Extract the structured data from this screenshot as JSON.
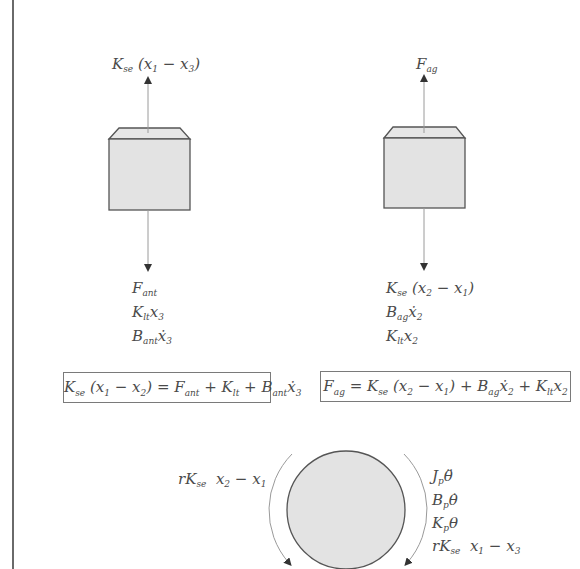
{
  "left_block": {
    "top_force": "K_se (x₁ − x₃)",
    "bottom_forces": [
      "F_ant",
      "K_lt x₃",
      "B_ant ẋ₃"
    ],
    "equation": "K_se (x₁ − x₂) = F_ant + K_lt + B_ant ẋ₃"
  },
  "right_block": {
    "top_force": "F_ag",
    "bottom_forces": [
      "K_se (x₂ − x₁)",
      "B_ag ẋ₂",
      "K_lt x₂"
    ],
    "equation": "F_ag = K_se (x₂ − x₁) + B_ag ẋ₂ + K_lt x₂"
  },
  "pulley": {
    "left_torque": "rK_se  x₂ − x₁",
    "right_torques": [
      "J_p θ̈",
      "B_p θ̇",
      "K_p θ",
      "rK_se  x₁ − x₃"
    ]
  },
  "colors": {
    "fill": "#e3e3e3",
    "stroke": "#555555",
    "arrow": "#9a9a9a",
    "text": "#4a4a4a"
  }
}
